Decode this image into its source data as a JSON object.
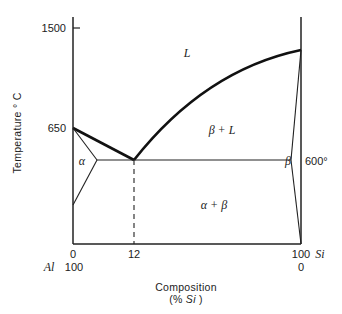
{
  "diagram": {
    "type": "binary phase diagram",
    "system": "Al-Si",
    "y_axis": {
      "label": "Temperature ° C",
      "ticks": [
        "1500",
        "650"
      ]
    },
    "x_axis": {
      "label_line1": "Composition",
      "label_line2_prefix": "(% ",
      "label_line2_italic": "Si",
      "label_line2_suffix": " )",
      "ticks_top": [
        "0",
        "12",
        "100"
      ],
      "ticks_bottom": [
        "100",
        "0"
      ],
      "left_element": "Al",
      "right_element": "Si"
    },
    "regions": {
      "liquid": "L",
      "beta_liquid": "β + L",
      "alpha": "α",
      "beta": "β",
      "alpha_beta": "α + β"
    },
    "annotations": {
      "eutectic_temp": "600°"
    }
  }
}
